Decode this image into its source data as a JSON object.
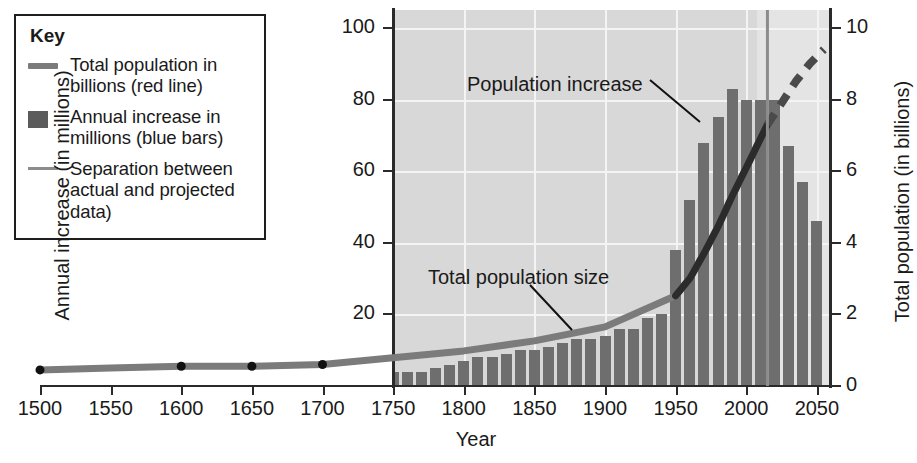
{
  "key": {
    "title": "Key",
    "items": [
      {
        "swatch": "red-line-swatch",
        "label": "Total population in billions (red line)"
      },
      {
        "swatch": "blue-bar-swatch",
        "label": "Annual increase in millions (blue bars)"
      },
      {
        "swatch": "separation-line-swatch",
        "label": "Separation between actual and projected data)"
      }
    ]
  },
  "annotations": {
    "population_increase": "Population increase",
    "total_population_size": "Total population size"
  },
  "colors": {
    "bar": "#6e6e6e",
    "line": "#7b7b7b",
    "line_dark": "#2b2b2b",
    "separation": "#8c8c8c",
    "plot_early": "#d8d8d8",
    "plot_late": "#e4e4e4",
    "grid": "#f4f4f4",
    "axis": "#2a2a2a"
  },
  "chart_data": {
    "type": "bar",
    "title": "",
    "xlabel": "Year",
    "ylabel": "Annual increase (in millions)",
    "y2label": "Total population (in billions)",
    "xlim": [
      1500,
      2060
    ],
    "ylim": [
      0,
      105
    ],
    "y2lim": [
      0,
      10.5
    ],
    "grid": true,
    "legend_position": "top-left-box",
    "xticks": [
      1500,
      1550,
      1600,
      1650,
      1700,
      1750,
      1800,
      1850,
      1900,
      1950,
      2000,
      2050
    ],
    "yticks": [
      20,
      40,
      60,
      80,
      100
    ],
    "y2ticks": [
      0,
      2,
      4,
      6,
      8,
      10
    ],
    "separation_year": 2015,
    "series": [
      {
        "name": "Annual increase in millions (blue bars)",
        "type": "bar",
        "axis": "left",
        "x": [
          1750,
          1760,
          1770,
          1780,
          1790,
          1800,
          1810,
          1820,
          1830,
          1840,
          1850,
          1860,
          1870,
          1880,
          1890,
          1900,
          1910,
          1920,
          1930,
          1940,
          1950,
          1960,
          1970,
          1980,
          1990,
          2000,
          2010,
          2020,
          2030,
          2040,
          2050
        ],
        "values": [
          4,
          4,
          4,
          5,
          6,
          7,
          8,
          8,
          9,
          10,
          10,
          11,
          12,
          13,
          13,
          14,
          16,
          16,
          19,
          20,
          38,
          52,
          68,
          75,
          83,
          80,
          80,
          80,
          67,
          57,
          46
        ]
      },
      {
        "name": "Total population in billions (red line)",
        "type": "line",
        "axis": "right",
        "x": [
          1500,
          1550,
          1600,
          1650,
          1700,
          1750,
          1800,
          1850,
          1900,
          1950,
          1960,
          1970,
          1980,
          1990,
          2000,
          2010,
          2015
        ],
        "values": [
          0.45,
          0.5,
          0.55,
          0.55,
          0.6,
          0.79,
          0.98,
          1.26,
          1.65,
          2.52,
          3.0,
          3.7,
          4.45,
          5.3,
          6.1,
          6.9,
          7.3
        ],
        "markers_at": [
          1500,
          1600,
          1650,
          1700
        ]
      },
      {
        "name": "Total population projected (dashed)",
        "type": "line-dashed",
        "axis": "right",
        "x": [
          2015,
          2025,
          2035,
          2045,
          2055
        ],
        "values": [
          7.3,
          7.9,
          8.5,
          9.0,
          9.4
        ]
      }
    ]
  }
}
